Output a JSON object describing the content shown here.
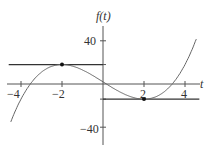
{
  "chart_data": {
    "type": "line",
    "title": "",
    "xlabel": "t",
    "ylabel": "f(t)",
    "xlim": [
      -4.6,
      4.7
    ],
    "ylim": [
      -55,
      60
    ],
    "x_ticks": [
      -4,
      -2,
      2,
      4
    ],
    "x_tick_labels": [
      "−4",
      "−2",
      "2",
      "4"
    ],
    "y_ticks": [
      40,
      -40
    ],
    "y_tick_labels": [
      "40",
      "−40"
    ],
    "grid": false,
    "series": [
      {
        "name": "f(t)",
        "function": "t^3 - 12t + 2",
        "x": [
          -4.5,
          -4,
          -3,
          -2,
          -1,
          0,
          1,
          2,
          3,
          4,
          4.5
        ],
        "y": [
          -35.1,
          -14,
          11,
          18,
          13,
          2,
          -9,
          -14,
          -7,
          18,
          39.1
        ]
      }
    ],
    "annotations": [
      {
        "type": "horizontal-tangent",
        "y": 18,
        "x_range": [
          -4.6,
          0
        ],
        "point": [
          -2,
          18
        ],
        "label": "local maximum"
      },
      {
        "type": "horizontal-tangent",
        "y": -14,
        "x_range": [
          0,
          4.7
        ],
        "point": [
          2,
          -14
        ],
        "label": "local minimum"
      }
    ]
  },
  "axes": {
    "x_label": "t",
    "y_label": "f(t)"
  },
  "ticks": {
    "x": [
      "−4",
      "−2",
      "2",
      "4"
    ],
    "y": [
      "40",
      "−40"
    ]
  }
}
